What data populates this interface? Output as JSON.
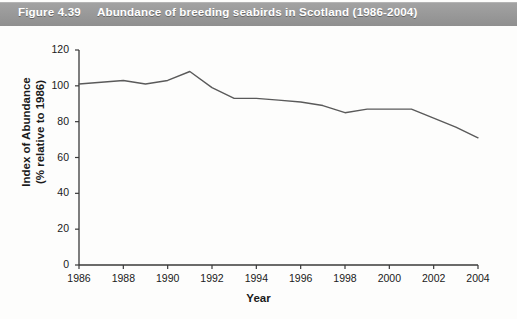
{
  "caption": {
    "figure_number": "Figure 4.39",
    "title": "Abundance of breeding seabirds in Scotland (1986-2004)",
    "bar_color": "#999999",
    "text_color": "#ffffff"
  },
  "chart_data": {
    "type": "line",
    "title": "Abundance of breeding seabirds in Scotland (1986-2004)",
    "xlabel": "Year",
    "ylabel": "Index of Abundance\n(% relative to 1986)",
    "ylabel_line1": "Index of Abundance",
    "ylabel_line2": "(% relative to 1986)",
    "xlim": [
      1986,
      2004
    ],
    "ylim": [
      0,
      120
    ],
    "ytick_values": [
      0,
      20,
      40,
      60,
      80,
      100,
      120
    ],
    "ytick_labels": [
      "0",
      "20",
      "40",
      "60",
      "80",
      "100",
      "120"
    ],
    "xtick_values": [
      1986,
      1988,
      1990,
      1992,
      1994,
      1996,
      1998,
      2000,
      2002,
      2004
    ],
    "xtick_labels": [
      "1986",
      "1988",
      "1990",
      "1992",
      "1994",
      "1996",
      "1998",
      "2000",
      "2002",
      "2004"
    ],
    "grid": false,
    "legend": false,
    "line_color": "#5a5a5a",
    "line_width": 1.4,
    "x": [
      1986,
      1987,
      1988,
      1989,
      1990,
      1991,
      1992,
      1993,
      1994,
      1995,
      1996,
      1997,
      1998,
      1999,
      2000,
      2001,
      2002,
      2003,
      2004
    ],
    "values": [
      101,
      102,
      103,
      101,
      103,
      108,
      99,
      93,
      93,
      92,
      91,
      89,
      85,
      87,
      87,
      87,
      82,
      77,
      71
    ],
    "series": [
      {
        "name": "Index of Abundance (% relative to 1986)",
        "values": [
          101,
          102,
          103,
          101,
          103,
          108,
          99,
          93,
          93,
          92,
          91,
          89,
          85,
          87,
          87,
          87,
          82,
          77,
          71
        ]
      }
    ]
  }
}
